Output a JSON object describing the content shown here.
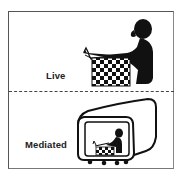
{
  "panels": [
    {
      "label": "Live",
      "illustration": "person-playing-chess-icon"
    },
    {
      "label": "Mediated",
      "illustration": "monitor-showing-chess-player-icon"
    }
  ],
  "colors": {
    "border": "#555555",
    "ink": "#111111",
    "background": "#ffffff"
  }
}
